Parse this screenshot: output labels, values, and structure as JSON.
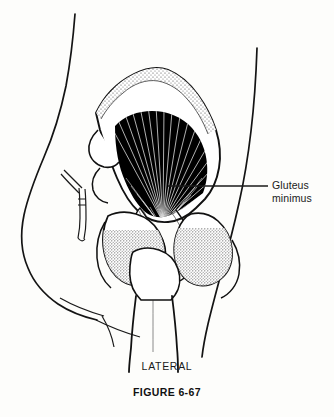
{
  "figure": {
    "title_caption": "FIGURE 6-67",
    "view_caption": "LATERAL",
    "callout": {
      "line1": "Gluteus",
      "line2": "minimus"
    },
    "colors": {
      "background": "#fdfdfb",
      "ink": "#111111",
      "muscle_fill": "#000000",
      "fiber_line": "#ffffff",
      "bone_stipple": "#555555",
      "bone_fill": "#ffffff"
    },
    "illustration": {
      "type": "anatomical-line-drawing",
      "region": "hip",
      "view": "lateral",
      "structures": [
        "body-contour-anterior",
        "body-contour-posterior",
        "ilium",
        "iliac-crest",
        "ischium",
        "ischial-tuberosity",
        "greater-trochanter",
        "femur-shaft",
        "gluteus-minimus-muscle",
        "gluteus-minimus-tendon"
      ]
    }
  }
}
